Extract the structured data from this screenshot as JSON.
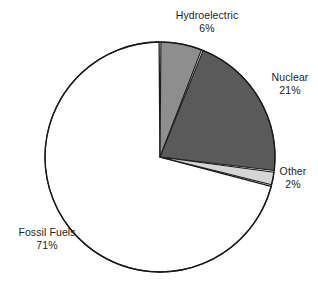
{
  "chart_data": {
    "type": "pie",
    "title": "",
    "subtitle": "",
    "xlabel": "",
    "ylabel": "",
    "grid": false,
    "legend": "none",
    "label_format": "name + percent, placed outside slices",
    "start_angle_deg": 0,
    "direction": "clockwise",
    "categories": [
      "Hydroelectric",
      "Nuclear",
      "Other",
      "Fossil Fuels"
    ],
    "values": [
      6,
      21,
      2,
      71
    ],
    "unit": "%",
    "total": 100,
    "slices": [
      {
        "name": "Hydroelectric",
        "value": 6,
        "value_label": "6%",
        "color": "#8e8e8e",
        "label_position": "top"
      },
      {
        "name": "Nuclear",
        "value": 21,
        "value_label": "21%",
        "color": "#5a5a5a",
        "label_position": "right"
      },
      {
        "name": "Other",
        "value": 2,
        "value_label": "2%",
        "color": "#d5d5d5",
        "label_position": "right-lower"
      },
      {
        "name": "Fossil Fuels",
        "value": 71,
        "value_label": "71%",
        "color": "#ffffff",
        "label_position": "bottom-left"
      }
    ]
  },
  "style": {
    "background": "#ffffff",
    "outline_color": "#1a1a1a",
    "text_color": "#1c1c1c"
  }
}
